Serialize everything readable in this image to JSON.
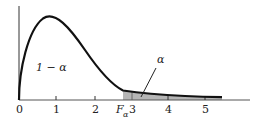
{
  "figure": {
    "type": "F-distribution density with upper-tail critical region",
    "area_left_label": "1 − α",
    "area_right_label": "α",
    "critical_value_label": "F",
    "critical_value_subscript": "α",
    "x_ticks": [
      "0",
      "1",
      "2",
      "3",
      "4",
      "5"
    ],
    "colors": {
      "curve": "#111111",
      "shade": "#b5b5b5",
      "axis": "#333333"
    }
  }
}
